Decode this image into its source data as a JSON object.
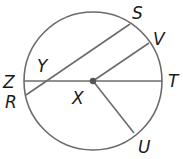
{
  "diagram": {
    "type": "circle-geometry",
    "circle": {
      "center": "X",
      "cx": 93,
      "cy": 81,
      "r": 69
    },
    "points": {
      "S": {
        "label": "S",
        "x": 130,
        "y": 24
      },
      "V": {
        "label": "V",
        "x": 149,
        "y": 43
      },
      "T": {
        "label": "T",
        "x": 162,
        "y": 81
      },
      "U": {
        "label": "U",
        "x": 134,
        "y": 133
      },
      "R": {
        "label": "R",
        "x": 26,
        "y": 95
      },
      "Z": {
        "label": "Z",
        "x": 24,
        "y": 81
      },
      "X": {
        "label": "X",
        "x": 93,
        "y": 81
      },
      "Y": {
        "label": "Y",
        "x": 47,
        "y": 81
      }
    },
    "segments": [
      {
        "name": "chord-RS",
        "from": "R",
        "to": "S"
      },
      {
        "name": "diameter-ZT",
        "from": "Z",
        "to": "T"
      },
      {
        "name": "radius-XV",
        "from": "X",
        "to": "V"
      },
      {
        "name": "radius-XU",
        "from": "X",
        "to": "U"
      }
    ],
    "colors": {
      "stroke": "#6b6b6b",
      "label": "#1a1a1a",
      "center_dot": "#555555"
    }
  }
}
